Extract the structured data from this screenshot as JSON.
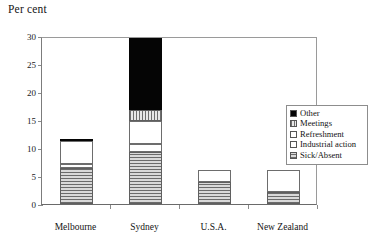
{
  "chart_data": {
    "type": "bar",
    "title": "",
    "ylabel": "Per cent",
    "xlabel": "",
    "ylim": [
      0,
      30
    ],
    "yticks": [
      0,
      5,
      10,
      15,
      20,
      25,
      30
    ],
    "ytick_labels": [
      "0",
      "5",
      "10",
      "15",
      "20",
      "25",
      "30"
    ],
    "grid": false,
    "stacked": true,
    "legend_position": "right",
    "categories": [
      "Melbourne",
      "Sydney",
      "U.S.A.",
      "New Zealand"
    ],
    "series": [
      {
        "name": "Sick/Absent",
        "pattern": "horizontal-stripes",
        "values": [
          6.4,
          9.3,
          3.9,
          2.1
        ]
      },
      {
        "name": "Industrial action",
        "pattern": "white",
        "values": [
          0.7,
          1.4,
          0.0,
          0.0
        ]
      },
      {
        "name": "Refreshment",
        "pattern": "white",
        "values": [
          4.2,
          4.1,
          2.1,
          3.9
        ]
      },
      {
        "name": "Meetings",
        "pattern": "vertical-stripes",
        "values": [
          0.0,
          2.0,
          0.0,
          0.0
        ]
      },
      {
        "name": "Other",
        "pattern": "solid-black",
        "values": [
          0.4,
          13.2,
          0.0,
          0.0
        ]
      }
    ],
    "totals": [
      11.7,
      30.0,
      6.0,
      6.0
    ]
  },
  "legend": {
    "items": [
      {
        "label": "Other",
        "swatch": "solid-black-swatch"
      },
      {
        "label": "Meetings",
        "swatch": "vertical-stripe-swatch"
      },
      {
        "label": "Refreshment",
        "swatch": "white-swatch"
      },
      {
        "label": "Industrial action",
        "swatch": "white-swatch"
      },
      {
        "label": "Sick/Absent",
        "swatch": "horizontal-stripe-swatch"
      }
    ]
  }
}
